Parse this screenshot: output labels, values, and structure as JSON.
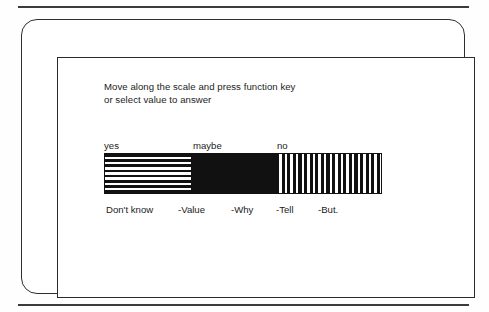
{
  "page": {
    "background_color": "#ffffff",
    "ink_color": "#1c1c1c"
  },
  "rules": {
    "top_rule": "",
    "bottom_rule": ""
  },
  "screen": {
    "outer_frame": "",
    "inner_frame": ""
  },
  "instructions": {
    "line1": "Move along the scale and press function key",
    "line2": "or select value to answer"
  },
  "scale": {
    "top_labels": [
      {
        "text": "yes",
        "left": 0
      },
      {
        "text": "maybe",
        "left": 89
      },
      {
        "text": "no",
        "left": 173
      }
    ],
    "segments": [
      {
        "name": "yes",
        "fill": "horizontal-lines",
        "width": 86,
        "color": "#111111"
      },
      {
        "name": "maybe",
        "fill": "solid-black",
        "width": 85,
        "color": "#111111"
      },
      {
        "name": "no",
        "fill": "vertical-lines",
        "width": 107,
        "color": "#111111"
      }
    ],
    "bottom_labels": [
      {
        "text": "Don't know",
        "left": 2
      },
      {
        "text": "-Value",
        "left": 74
      },
      {
        "text": "-Why",
        "left": 127
      },
      {
        "text": "-Tell",
        "left": 172
      },
      {
        "text": "-But.",
        "left": 214
      }
    ]
  }
}
